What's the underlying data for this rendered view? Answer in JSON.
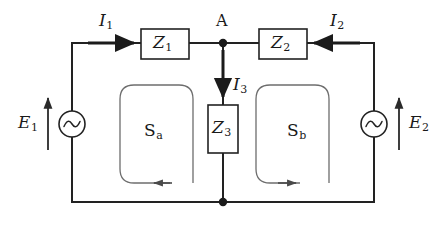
{
  "diagram": {
    "type": "electrical-circuit-schematic",
    "background_color": "#ffffff",
    "line_color": "#222222",
    "loop_color": "#666666",
    "text_color": "#1a1a1a"
  },
  "impedances": [
    {
      "id": "Z1",
      "symbol": "Z",
      "subscript": "1",
      "orientation": "horizontal",
      "branch": "top-left",
      "box": {
        "x": 141,
        "y": 29,
        "w": 48,
        "h": 30
      }
    },
    {
      "id": "Z2",
      "symbol": "Z",
      "subscript": "2",
      "orientation": "horizontal",
      "branch": "top-right",
      "box": {
        "x": 259,
        "y": 29,
        "w": 48,
        "h": 30
      }
    },
    {
      "id": "Z3",
      "symbol": "Z",
      "subscript": "3",
      "orientation": "vertical",
      "branch": "middle-shunt",
      "box": {
        "x": 208,
        "y": 105,
        "w": 30,
        "h": 48
      }
    }
  ],
  "sources": [
    {
      "id": "E1",
      "symbol": "E",
      "subscript": "1",
      "kind": "ac-voltage-source",
      "side": "left",
      "polarity_arrow": "up",
      "label_side": "left",
      "center": {
        "x": 72,
        "y": 124
      },
      "radius": 13
    },
    {
      "id": "E2",
      "symbol": "E",
      "subscript": "2",
      "kind": "ac-voltage-source",
      "side": "right",
      "polarity_arrow": "up",
      "label_side": "right",
      "center": {
        "x": 374,
        "y": 124
      },
      "radius": 13
    }
  ],
  "currents": [
    {
      "id": "I1",
      "symbol": "I",
      "subscript": "1",
      "direction": "right",
      "branch": "top-left",
      "arrow": {
        "x1": 88,
        "y1": 43,
        "x2": 136,
        "y2": 43
      }
    },
    {
      "id": "I2",
      "symbol": "I",
      "subscript": "2",
      "direction": "left",
      "branch": "top-right",
      "arrow": {
        "x1": 360,
        "y1": 43,
        "x2": 312,
        "y2": 43
      }
    },
    {
      "id": "I3",
      "symbol": "I",
      "subscript": "3",
      "direction": "down",
      "branch": "middle-shunt",
      "arrow": {
        "x1": 223,
        "y1": 48,
        "x2": 223,
        "y2": 99
      }
    }
  ],
  "nodes": [
    {
      "id": "A",
      "label": "A",
      "x": 223,
      "y": 43,
      "label_position": "above",
      "filled": true
    },
    {
      "id": "bottom-junction",
      "label": "",
      "x": 223,
      "y": 202,
      "label_position": "none",
      "filled": true
    }
  ],
  "meshes": [
    {
      "id": "Sa",
      "symbol": "S",
      "subscript": "a",
      "orientation": "counterclockwise",
      "arrow_direction": "left",
      "label_center": {
        "x": 152,
        "y": 131
      },
      "path": {
        "x": 120,
        "y": 85,
        "w": 73,
        "h": 98,
        "r": 14
      }
    },
    {
      "id": "Sb",
      "symbol": "S",
      "subscript": "b",
      "orientation": "clockwise",
      "arrow_direction": "right",
      "label_center": {
        "x": 295,
        "y": 131
      },
      "path": {
        "x": 256,
        "y": 85,
        "w": 73,
        "h": 98,
        "r": 14
      }
    }
  ],
  "outer_loop": {
    "x": 72,
    "y": 43,
    "w": 302,
    "h": 159
  }
}
